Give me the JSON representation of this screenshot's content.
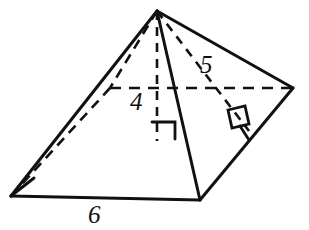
{
  "figure": {
    "name": "square-pyramid-diagram",
    "stroke_color": "#111111",
    "background_color": "#ffffff",
    "labels": {
      "height": "4",
      "slant_height": "5",
      "base_edge": "6"
    },
    "vertices": {
      "apex": [
        157,
        11
      ],
      "front_bottom": [
        200,
        200
      ],
      "left": [
        11,
        196
      ],
      "right": [
        293,
        88
      ],
      "back_hidden": [
        110,
        88
      ]
    },
    "altitude_foot": [
      157,
      140
    ],
    "slant_foot": [
      249,
      131
    ],
    "right_angle_markers": 2
  }
}
